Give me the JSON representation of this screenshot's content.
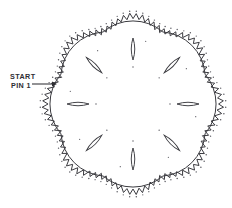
{
  "diagram": {
    "background_color": "#ffffff",
    "ink_color": "#3a3a3f",
    "pin_color": "#55555c",
    "canvas": {
      "width": 232,
      "height": 208
    },
    "center": {
      "x": 133,
      "y": 104
    },
    "lobe_count": 8,
    "outer_radius": 88,
    "sawtooth": {
      "teeth_total": 88,
      "amplitude": 5,
      "inner_radius": 79,
      "outer_radius": 88
    },
    "arcs": {
      "count": 8,
      "description": "large chord arcs spanning adjacent lobe valleys",
      "sweep_radius": 46
    },
    "leaves": {
      "count": 8,
      "orientation": "radial",
      "length": 22,
      "width": 7,
      "center_radius": 55
    },
    "pins": {
      "description": "small dots marking pin positions along the sawtooth and inside the lobes"
    }
  },
  "annotation": {
    "start_label": "START",
    "pin_label": "PIN 1",
    "arrow": {
      "name": "start-arrow",
      "from": {
        "x": 32,
        "y": 84
      },
      "to": {
        "x": 57,
        "y": 84
      }
    },
    "text_position": {
      "x": 10,
      "y": 79
    }
  }
}
